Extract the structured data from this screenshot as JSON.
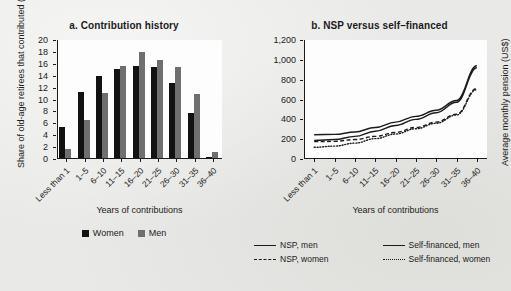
{
  "figure": {
    "background_color": "#e9e9e7",
    "plot_background_color": "#fdfdfd",
    "ink_color": "#1b1b1b"
  },
  "chart_data": [
    {
      "id": "a",
      "type": "bar",
      "title": "a. Contribution history",
      "xlabel": "Years of contributions",
      "ylabel": "Share of old-age retirees that contributed (%)",
      "ylim": [
        0,
        20
      ],
      "yticks": [
        0,
        2,
        4,
        6,
        8,
        10,
        12,
        14,
        16,
        18,
        20
      ],
      "grid": false,
      "legend_position": "bottom",
      "categories": [
        "Less than 1",
        "1–5",
        "6–10",
        "11–15",
        "16–20",
        "21–25",
        "26–30",
        "31–35",
        "36–40"
      ],
      "series": [
        {
          "name": "Women",
          "color": "#121212",
          "values": [
            5.3,
            11.2,
            14.0,
            15.1,
            15.6,
            15.5,
            12.8,
            7.8,
            0.4
          ]
        },
        {
          "name": "Men",
          "color": "#6f6f6f",
          "values": [
            1.6,
            6.6,
            11.1,
            15.7,
            18.0,
            16.7,
            15.4,
            11.0,
            1.2
          ]
        }
      ]
    },
    {
      "id": "b",
      "type": "line",
      "title": "b. NSP versus self–financed",
      "xlabel": "Years of contributions",
      "ylabel": "Average monthly pension (US$)",
      "ylim": [
        0,
        1200
      ],
      "yticks": [
        0,
        200,
        400,
        600,
        800,
        1000,
        1200
      ],
      "ytick_labels": [
        "0",
        "200",
        "400",
        "600",
        "800",
        "1,000",
        "1,200"
      ],
      "grid": false,
      "legend_position": "bottom",
      "categories": [
        "Less than 1",
        "1–5",
        "6–10",
        "11–15",
        "16–20",
        "21–25",
        "26–30",
        "31–35",
        "36–40"
      ],
      "series": [
        {
          "name": "NSP, men",
          "style": "solid",
          "color": "#1b1b1b",
          "values": [
            245,
            248,
            272,
            318,
            372,
            430,
            492,
            590,
            940
          ]
        },
        {
          "name": "NSP, women",
          "style": "dashed",
          "color": "#1b1b1b",
          "values": [
            175,
            178,
            196,
            228,
            268,
            318,
            372,
            452,
            712
          ]
        },
        {
          "name": "Self-financed, men",
          "style": "solid",
          "color": "#1b1b1b",
          "values": [
            188,
            196,
            228,
            280,
            338,
            400,
            466,
            572,
            920
          ]
        },
        {
          "name": "Self-financed, women",
          "style": "dotted",
          "color": "#1b1b1b",
          "values": [
            118,
            130,
            160,
            205,
            252,
            305,
            360,
            444,
            700
          ]
        }
      ]
    }
  ]
}
